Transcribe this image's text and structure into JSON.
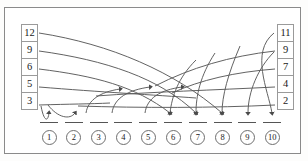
{
  "diagram": {
    "frame_color": "#8a8a8a",
    "edge_color": "#5a5a5a",
    "left_column": {
      "name": "left-values",
      "values": [
        "12",
        "9",
        "6",
        "5",
        "3"
      ]
    },
    "right_column": {
      "name": "right-values",
      "values": [
        "11",
        "9",
        "7",
        "4",
        "2"
      ]
    },
    "bottom_row": {
      "name": "target-slots",
      "labels": [
        "1",
        "2",
        "3",
        "4",
        "5",
        "6",
        "7",
        "8",
        "9",
        "10"
      ]
    },
    "edges": [
      {
        "from": "left:12",
        "to": "slot:8"
      },
      {
        "from": "left:9",
        "to": "slot:7"
      },
      {
        "from": "left:6",
        "to": "slot:5"
      },
      {
        "from": "left:5",
        "to": "slot:4"
      },
      {
        "from": "left:3",
        "to": "slot:1"
      },
      {
        "from": "left:3",
        "to": "slot:2"
      },
      {
        "from": "right:11",
        "to": "slot:10"
      },
      {
        "from": "right:9",
        "to": "slot:9"
      },
      {
        "from": "right:7",
        "to": "slot:6"
      },
      {
        "from": "right:4",
        "to": "slot:3"
      },
      {
        "from": "right:2",
        "to": "slot:3"
      }
    ]
  }
}
